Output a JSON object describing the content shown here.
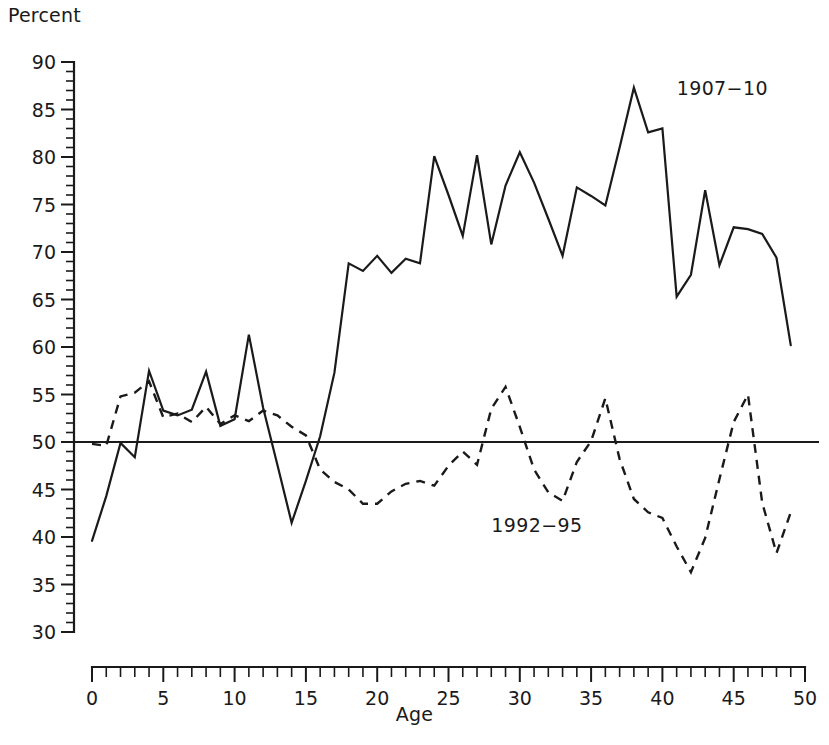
{
  "chart_data": {
    "type": "line",
    "title": "",
    "xlabel": "Age",
    "ylabel": "Percent",
    "xlim": [
      0,
      50
    ],
    "ylim": [
      30,
      90
    ],
    "grid": false,
    "legend_position": "inline-annotation",
    "x_ticks_major": [
      0,
      5,
      10,
      15,
      20,
      25,
      30,
      35,
      40,
      45,
      50
    ],
    "x_tick_labels": [
      "0",
      "5",
      "10",
      "15",
      "20",
      "25",
      "30",
      "35",
      "40",
      "45",
      "50"
    ],
    "x_minor_step": 1,
    "y_ticks_major": [
      30,
      35,
      40,
      45,
      50,
      55,
      60,
      65,
      70,
      75,
      80,
      85,
      90
    ],
    "y_tick_labels": [
      "30",
      "35",
      "40",
      "45",
      "50",
      "55",
      "60",
      "65",
      "70",
      "75",
      "80",
      "85",
      "90"
    ],
    "y_minor_step": 1,
    "reference_line": {
      "value": 50,
      "style": "solid",
      "label": ""
    },
    "x": [
      0,
      1,
      2,
      3,
      4,
      5,
      6,
      7,
      8,
      9,
      10,
      11,
      12,
      13,
      14,
      15,
      16,
      17,
      18,
      19,
      20,
      21,
      22,
      23,
      24,
      25,
      26,
      27,
      28,
      29,
      30,
      31,
      32,
      33,
      34,
      35,
      36,
      37,
      38,
      39,
      40,
      41,
      42,
      43,
      44,
      45,
      46,
      47,
      48,
      49
    ],
    "series": [
      {
        "name": "1907-10",
        "label": "1907−10",
        "style": "solid",
        "color": "#1a1a1a",
        "label_x": 41.0,
        "label_y": 86.5,
        "values": [
          39.6,
          44.3,
          49.9,
          48.4,
          57.5,
          53.3,
          52.8,
          53.4,
          57.4,
          51.7,
          52.4,
          61.3,
          53.6,
          47.6,
          41.5,
          45.9,
          50.6,
          57.3,
          68.8,
          68.0,
          69.6,
          67.8,
          69.3,
          68.8,
          80.1,
          76.0,
          71.7,
          80.2,
          70.8,
          77.0,
          80.5,
          77.3,
          73.5,
          69.6,
          76.8,
          75.9,
          74.9,
          81.0,
          87.3,
          82.6,
          83.0,
          65.3,
          67.6,
          76.5,
          68.6,
          72.6,
          72.4,
          71.9,
          69.4,
          60.2
        ]
      },
      {
        "name": "1992-95",
        "label": "1992−95",
        "style": "dashed",
        "color": "#1a1a1a",
        "label_x": 28.0,
        "label_y": 40.5,
        "values": [
          49.8,
          49.6,
          54.8,
          55.2,
          56.4,
          52.6,
          53.0,
          52.1,
          53.7,
          51.9,
          52.8,
          52.2,
          53.3,
          52.8,
          51.6,
          50.7,
          47.1,
          45.8,
          45.0,
          43.5,
          43.5,
          44.8,
          45.6,
          45.9,
          45.4,
          47.5,
          49.0,
          47.6,
          53.5,
          55.8,
          51.6,
          47.1,
          44.7,
          43.8,
          47.9,
          50.1,
          54.6,
          48.2,
          44.0,
          42.6,
          42.0,
          39.0,
          36.3,
          39.9,
          46.1,
          52.1,
          55.0,
          43.6,
          38.3,
          42.6
        ]
      }
    ]
  },
  "labels": {
    "percent": "Percent",
    "age": "Age"
  }
}
